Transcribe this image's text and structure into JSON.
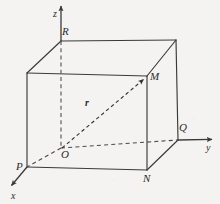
{
  "figure": {
    "kind": "3d-coordinate-box-diagram",
    "background_color": "#f4f3f1",
    "line_color": "#3a3a3a",
    "dash_color": "#4a4a4a",
    "label_color": "#2b2b2b"
  },
  "axes": [
    {
      "id": "x",
      "label": "x",
      "label_x": 11,
      "label_y": 191,
      "arrow_tip": [
        8,
        189
      ],
      "origin": [
        62,
        148
      ]
    },
    {
      "id": "y",
      "label": "y",
      "label_x": 206,
      "label_y": 143,
      "arrow_tip": [
        217,
        139
      ],
      "origin": [
        62,
        148
      ]
    },
    {
      "id": "z",
      "label": "z",
      "label_x": 53,
      "label_y": 9,
      "arrow_tip": [
        61,
        2
      ],
      "origin": [
        62,
        148
      ]
    }
  ],
  "points": [
    {
      "id": "O",
      "label": "O",
      "label_x": 61,
      "label_y": 149,
      "px": 62,
      "py": 148,
      "role": "origin"
    },
    {
      "id": "P",
      "label": "P",
      "label_x": 16,
      "label_y": 161,
      "px": 27,
      "py": 167,
      "role": "x-intercept"
    },
    {
      "id": "Q",
      "label": "Q",
      "label_x": 179,
      "label_y": 122,
      "px": 178,
      "py": 140,
      "role": "y-intercept"
    },
    {
      "id": "R",
      "label": "R",
      "label_x": 62,
      "label_y": 26,
      "px": 61,
      "py": 41,
      "role": "z-intercept"
    },
    {
      "id": "M",
      "label": "M",
      "label_x": 150,
      "label_y": 71,
      "px": 147,
      "py": 76,
      "role": "vector-head"
    },
    {
      "id": "N",
      "label": "N",
      "label_x": 143,
      "label_y": 173,
      "px": 147,
      "py": 170,
      "role": "bottom-front-right"
    }
  ],
  "vector": {
    "id": "r",
    "label": "r",
    "label_x": 85,
    "label_y": 98,
    "from": "O",
    "to": "M",
    "style": "dashed-with-arrowhead",
    "bold_italic": true
  },
  "box": {
    "vertices": {
      "top_back_left": [
        61,
        41
      ],
      "top_back_right": [
        176,
        40
      ],
      "top_front_left": [
        27,
        73
      ],
      "top_front_right": [
        147,
        76
      ],
      "bottom_back_left": [
        61,
        148
      ],
      "bottom_back_right": [
        178,
        140
      ],
      "bottom_front_left": [
        27,
        167
      ],
      "bottom_front_right": [
        147,
        170
      ]
    },
    "solid_edges": 9,
    "dashed_edges": 3
  }
}
